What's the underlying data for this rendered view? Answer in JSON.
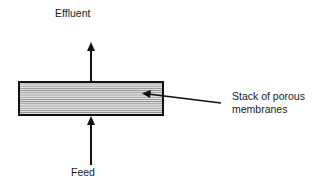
{
  "diagram": {
    "labels": {
      "top": "Effluent",
      "bottom": "Feed",
      "callout_line1": "Stack of porous",
      "callout_line2": "membranes"
    },
    "colors": {
      "stroke": "#111111",
      "fill": "#9a9a9a",
      "stripe": "#e6e6e6"
    },
    "elements": {
      "stack": "membrane-stack",
      "arrows": [
        "feed-arrow-up",
        "effluent-arrow-up",
        "callout-pointer"
      ]
    }
  }
}
